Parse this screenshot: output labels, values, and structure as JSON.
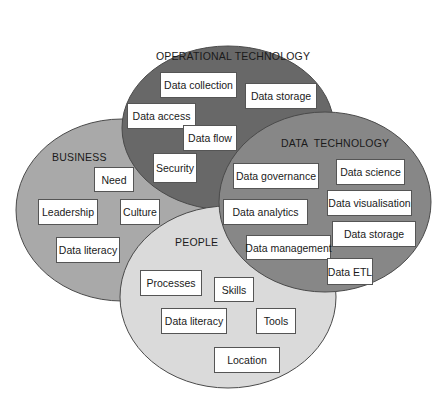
{
  "colors": {
    "operational": "#686868",
    "business": "#a9a9a9",
    "data_technology": "#878787",
    "people": "#dadada",
    "outline": "#4a4a4a",
    "box_fill": "#ffffff"
  },
  "regions": {
    "operational": {
      "label": "OPERATIONAL TECHNOLOGY",
      "items": [
        "Data collection",
        "Data storage",
        "Data access",
        "Data flow",
        "Security"
      ]
    },
    "business": {
      "label": "BUSINESS",
      "items": [
        "Need",
        "Leadership",
        "Culture",
        "Data literacy"
      ]
    },
    "data_technology": {
      "label": "DATA  TECHNOLOGY",
      "items": [
        "Data governance",
        "Data science",
        "Data visualisation",
        "Data analytics",
        "Data storage",
        "Data management",
        "Data ETL"
      ]
    },
    "people": {
      "label": "PEOPLE",
      "items": [
        "Processes",
        "Skills",
        "Data literacy",
        "Tools",
        "Location"
      ]
    }
  }
}
